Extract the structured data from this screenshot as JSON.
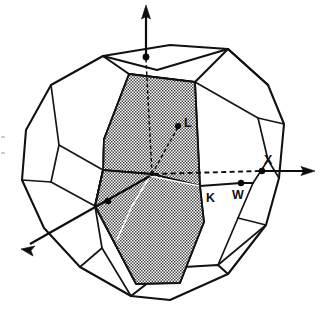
{
  "figure": {
    "kind": "brillouin-zone-diagram",
    "caption_text": "",
    "background_color": "#ffffff",
    "line_color": "#111111",
    "shading_color": "#8a8a8a",
    "shading_description": "fine stipple / hatch fill at about 50% gray"
  },
  "labels": [
    {
      "id": "L",
      "text": "L",
      "x": 184,
      "y": 117
    },
    {
      "id": "X",
      "text": "X",
      "x": 264,
      "y": 154
    },
    {
      "id": "W",
      "text": "W",
      "x": 232,
      "y": 189
    },
    {
      "id": "K",
      "text": "K",
      "x": 206,
      "y": 192
    }
  ],
  "points": [
    {
      "id": "gamma",
      "name": "zone-center",
      "x": 152,
      "y": 174
    },
    {
      "id": "L",
      "name": "point-L",
      "x": 178,
      "y": 126
    },
    {
      "id": "X",
      "name": "point-X",
      "x": 262,
      "y": 170
    },
    {
      "id": "W",
      "name": "point-W",
      "x": 241,
      "y": 183
    },
    {
      "id": "top",
      "name": "point-top-axis",
      "x": 146,
      "y": 57
    },
    {
      "id": "left",
      "name": "point-left-axis",
      "x": 108,
      "y": 201
    }
  ],
  "axes": [
    {
      "id": "axis-vertical",
      "from": [
        146,
        57
      ],
      "to": [
        146,
        8
      ],
      "arrow": "up"
    },
    {
      "id": "axis-right",
      "from": [
        152,
        174
      ],
      "to": [
        311,
        174
      ],
      "arrow": "right"
    },
    {
      "id": "axis-lower-left",
      "from": [
        152,
        174
      ],
      "to": [
        22,
        248
      ],
      "arrow": "down-left"
    }
  ],
  "shapes": {
    "outer_polygon": "truncated octahedron (first Brillouin zone of FCC lattice)",
    "section_polygon": "shaded irregular cross-section plane through the zone center"
  }
}
